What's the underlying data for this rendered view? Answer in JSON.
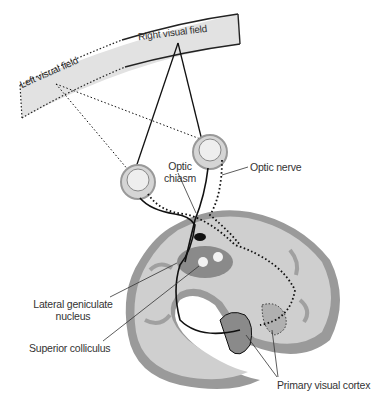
{
  "diagram": {
    "type": "anatomical-illustration",
    "labels": {
      "right_visual_field": "Right visual field",
      "left_visual_field": "Left visual field",
      "optic_chiasm_line1": "Optic",
      "optic_chiasm_line2": "chiasm",
      "optic_nerve": "Optic nerve",
      "lgn_line1": "Lateral geniculate",
      "lgn_line2": "nucleus",
      "superior_colliculus": "Superior colliculus",
      "primary_visual_cortex": "Primary visual cortex"
    },
    "colors": {
      "band_fill": "#e2e2e2",
      "brain_light": "#cfcfcf",
      "brain_mid": "#a8a8a8",
      "brain_dark": "#7a7a7a",
      "line": "#111111",
      "text": "#333333"
    },
    "legend": {
      "solid_line": "Right visual field pathway",
      "dotted_line": "Left visual field pathway"
    }
  }
}
